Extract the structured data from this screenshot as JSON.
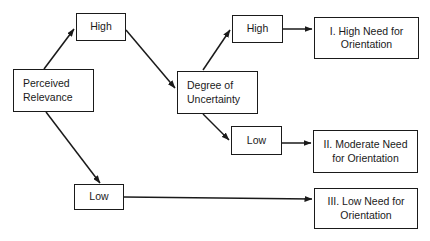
{
  "diagram": {
    "nodes": {
      "perceived_relevance": "Perceived\nRelevance",
      "high_relevance": "High",
      "low_relevance": "Low",
      "degree_of_uncertainty": "Degree of\nUncertainty",
      "high_uncertainty": "High",
      "low_uncertainty": "Low",
      "outcome_high": "I. High Need for\nOrientation",
      "outcome_moderate": "II. Moderate Need\nfor Orientation",
      "outcome_low": "III. Low Need for\nOrientation"
    },
    "edges": [
      {
        "from": "Perceived Relevance",
        "to": "High"
      },
      {
        "from": "Perceived Relevance",
        "to": "Low"
      },
      {
        "from": "High",
        "to": "Degree of Uncertainty"
      },
      {
        "from": "Degree of Uncertainty",
        "to": "High"
      },
      {
        "from": "Degree of Uncertainty",
        "to": "Low"
      },
      {
        "from": "High",
        "to": "I. High Need for Orientation"
      },
      {
        "from": "Low",
        "to": "II. Moderate Need for Orientation"
      },
      {
        "from": "Low",
        "to": "III. Low Need for Orientation"
      }
    ],
    "colors": {
      "line": "#1a1a1a",
      "background": "#ffffff"
    }
  }
}
